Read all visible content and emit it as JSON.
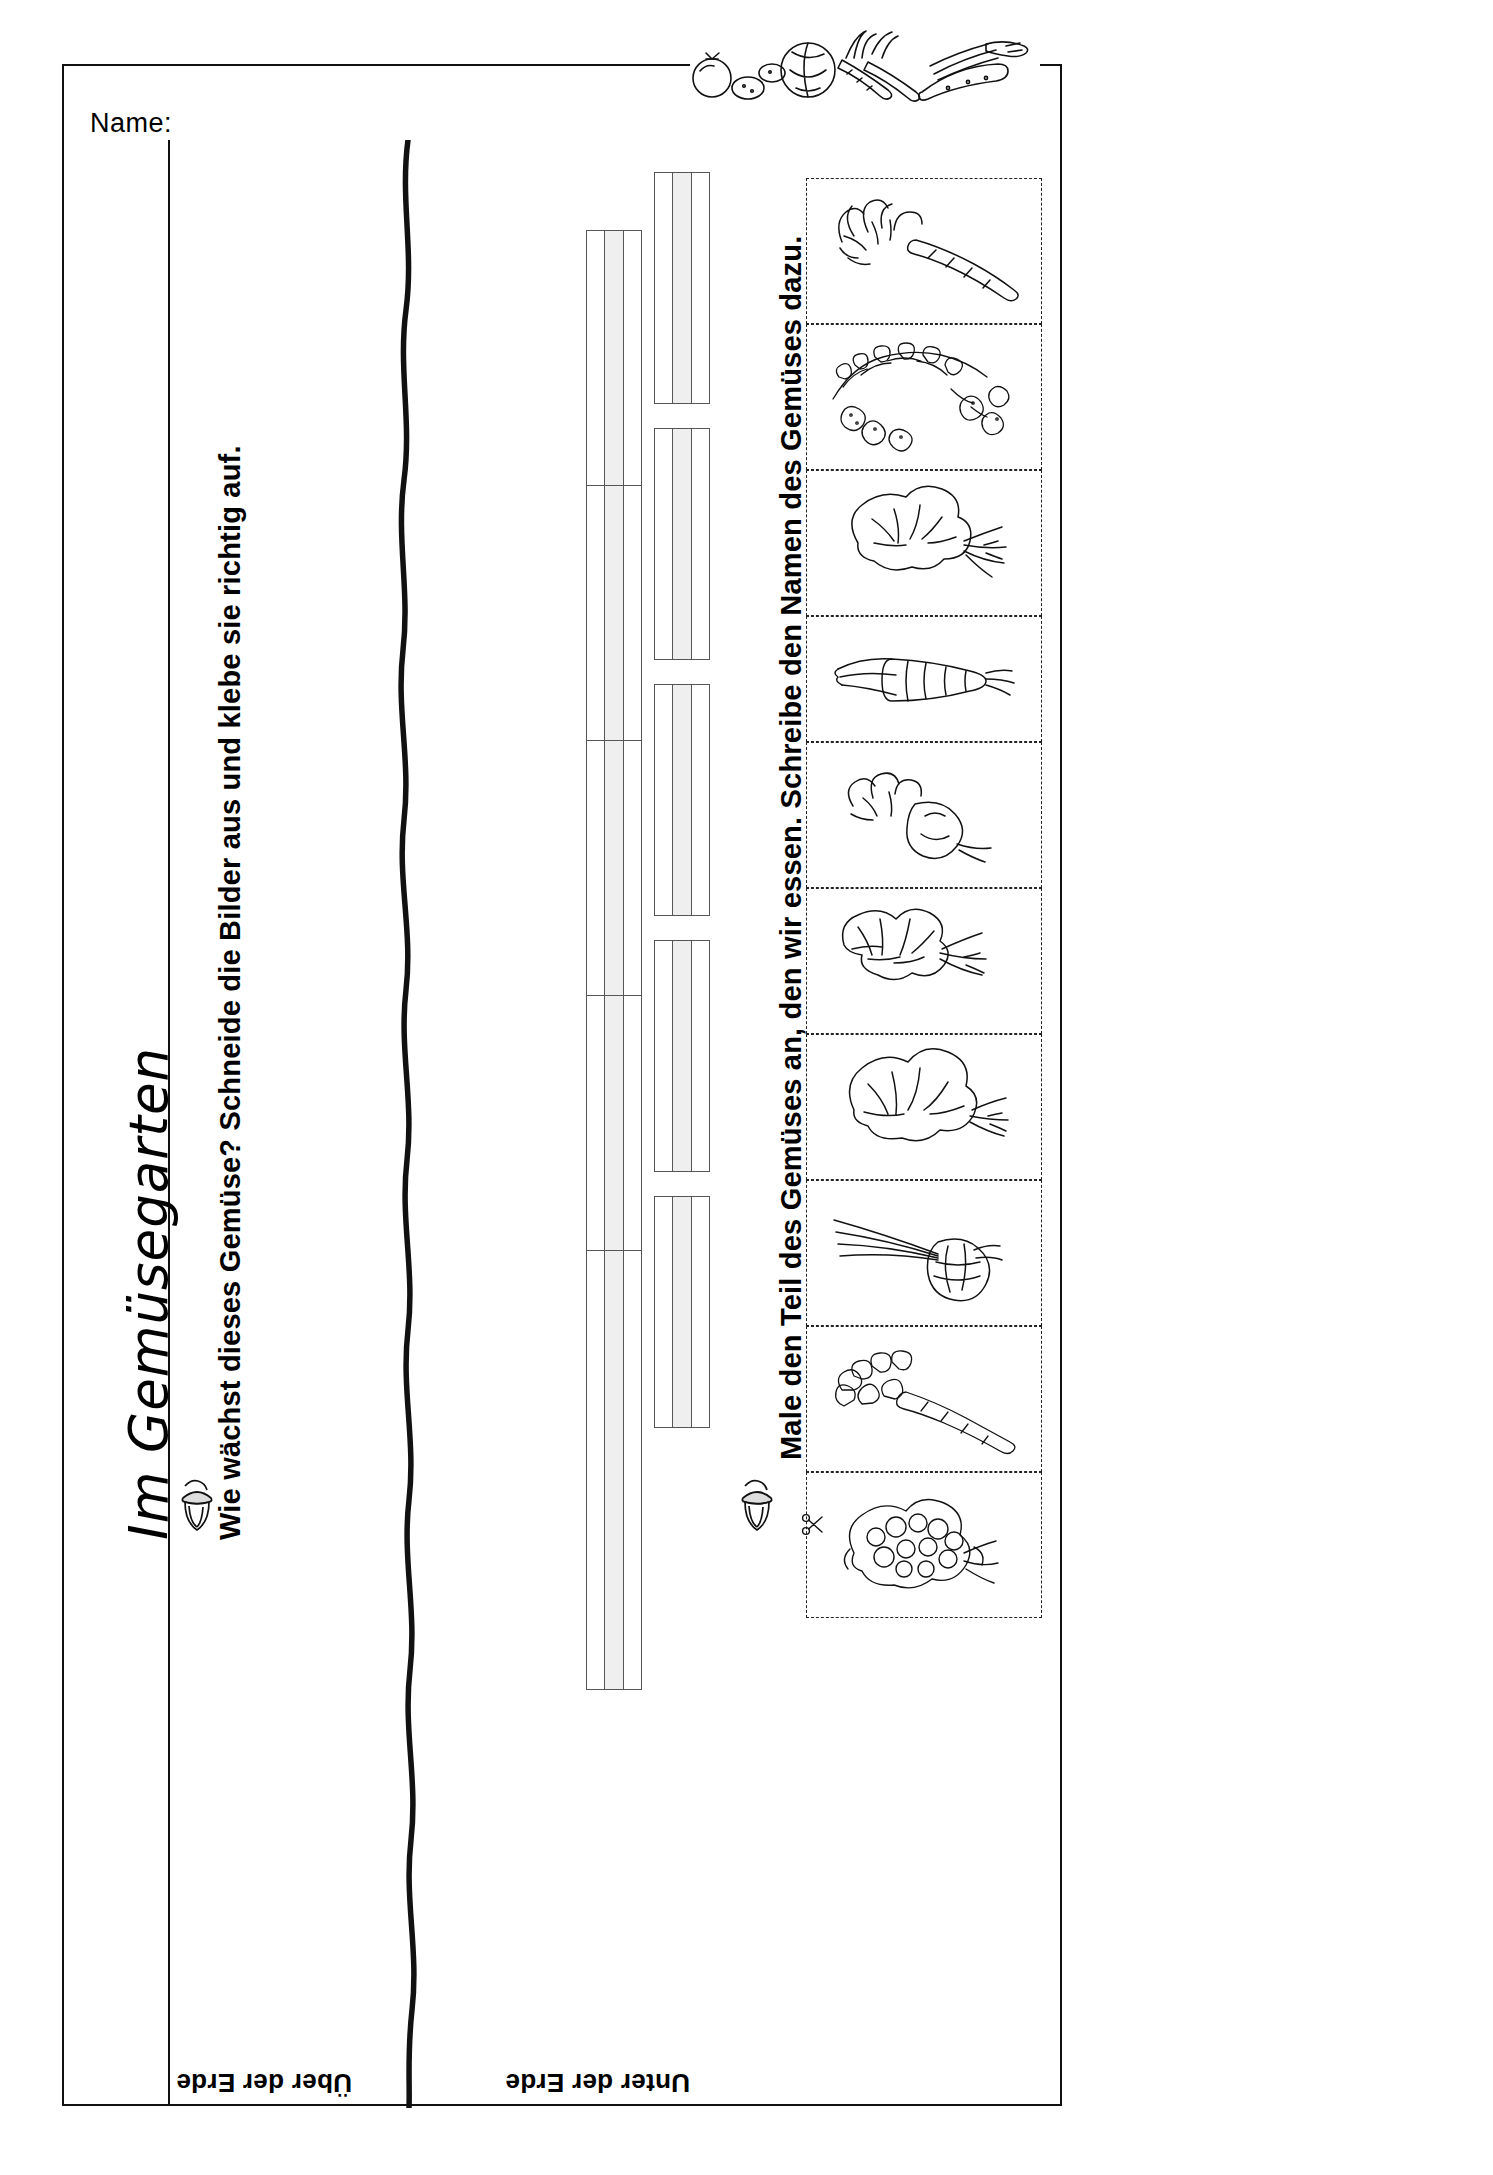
{
  "page": {
    "title": "Im Gemüsegarten",
    "name_label": "Name:",
    "width": 1493,
    "height": 2175
  },
  "tasks": [
    {
      "id": "task-1",
      "bullet": "acorn-icon",
      "text": "Wie wächst dieses Gemüse? Schneide die Bilder aus und klebe sie richtig auf."
    },
    {
      "id": "task-2",
      "bullet": "acorn-icon",
      "text": "Male den Teil des Gemüses an, den wir essen. Schreibe den Namen des Gemüses dazu."
    }
  ],
  "soil_labels": {
    "above": "Über der Erde",
    "below": "Unter der Erde"
  },
  "answer_boxes": {
    "count": 10,
    "cells_per_box": 3,
    "note": "leere Klebefelder",
    "rows": [
      {
        "column": "oben",
        "index": 1
      },
      {
        "column": "oben",
        "index": 2
      },
      {
        "column": "oben",
        "index": 3
      },
      {
        "column": "oben",
        "index": 4
      },
      {
        "column": "oben",
        "index": 5
      },
      {
        "column": "unten",
        "index": 1
      },
      {
        "column": "unten",
        "index": 2
      },
      {
        "column": "unten",
        "index": 3
      },
      {
        "column": "unten",
        "index": 4
      },
      {
        "column": "unten",
        "index": 5
      }
    ]
  },
  "pictures": [
    {
      "index": 1,
      "name": "Möhre / Karotte",
      "icon": "carrot-icon"
    },
    {
      "index": 2,
      "name": "Kartoffelpflanze",
      "icon": "potato-plant-icon"
    },
    {
      "index": 3,
      "name": "Sellerie",
      "icon": "celeriac-icon"
    },
    {
      "index": 4,
      "name": "Lauch / Porree",
      "icon": "leek-icon"
    },
    {
      "index": 5,
      "name": "Radieschen",
      "icon": "radish-icon"
    },
    {
      "index": 6,
      "name": "Mangold",
      "icon": "chard-icon"
    },
    {
      "index": 7,
      "name": "Kohlrabi",
      "icon": "kohlrabi-icon"
    },
    {
      "index": 8,
      "name": "Zwiebel",
      "icon": "onion-icon"
    },
    {
      "index": 9,
      "name": "Pastinake",
      "icon": "parsnip-icon"
    },
    {
      "index": 10,
      "name": "Blumenkohl",
      "icon": "cauliflower-icon"
    }
  ],
  "cut_line": {
    "icon": "scissors-icon",
    "glyph": "✂"
  },
  "clipart": {
    "icon": "vegetable-assortment-icon",
    "items": [
      "Tomate",
      "Kartoffeln",
      "Kohl",
      "Möhren",
      "Gurke",
      "Lauch"
    ]
  },
  "colors": {
    "ink": "#111111",
    "cell_fill": "#efefef",
    "border": "#555555",
    "dashed": "#222222"
  }
}
